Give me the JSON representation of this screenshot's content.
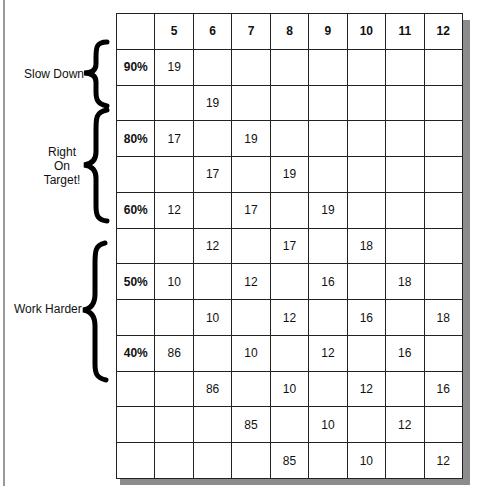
{
  "grid": {
    "columns": [
      "",
      "5",
      "6",
      "7",
      "8",
      "9",
      "10",
      "11",
      "12"
    ],
    "rows": [
      [
        "90%",
        "19",
        "",
        "",
        "",
        "",
        "",
        "",
        ""
      ],
      [
        "",
        "",
        "19",
        "",
        "",
        "",
        "",
        "",
        ""
      ],
      [
        "80%",
        "17",
        "",
        "19",
        "",
        "",
        "",
        "",
        ""
      ],
      [
        "",
        "",
        "17",
        "",
        "19",
        "",
        "",
        "",
        ""
      ],
      [
        "60%",
        "12",
        "",
        "17",
        "",
        "19",
        "",
        "",
        ""
      ],
      [
        "",
        "",
        "12",
        "",
        "17",
        "",
        "18",
        "",
        ""
      ],
      [
        "50%",
        "10",
        "",
        "12",
        "",
        "16",
        "",
        "18",
        ""
      ],
      [
        "",
        "",
        "10",
        "",
        "12",
        "",
        "16",
        "",
        "18"
      ],
      [
        "40%",
        "86",
        "",
        "10",
        "",
        "12",
        "",
        "16",
        ""
      ],
      [
        "",
        "",
        "86",
        "",
        "10",
        "",
        "12",
        "",
        "16"
      ],
      [
        "",
        "",
        "",
        "85",
        "",
        "10",
        "",
        "12",
        ""
      ],
      [
        "",
        "",
        "",
        "",
        "85",
        "",
        "10",
        "",
        "12"
      ]
    ]
  },
  "labels": {
    "slow_down": "Slow Down",
    "right_on_target_1": "Right",
    "right_on_target_2": "On",
    "right_on_target_3": "Target!",
    "work_harder": "Work Harder"
  }
}
